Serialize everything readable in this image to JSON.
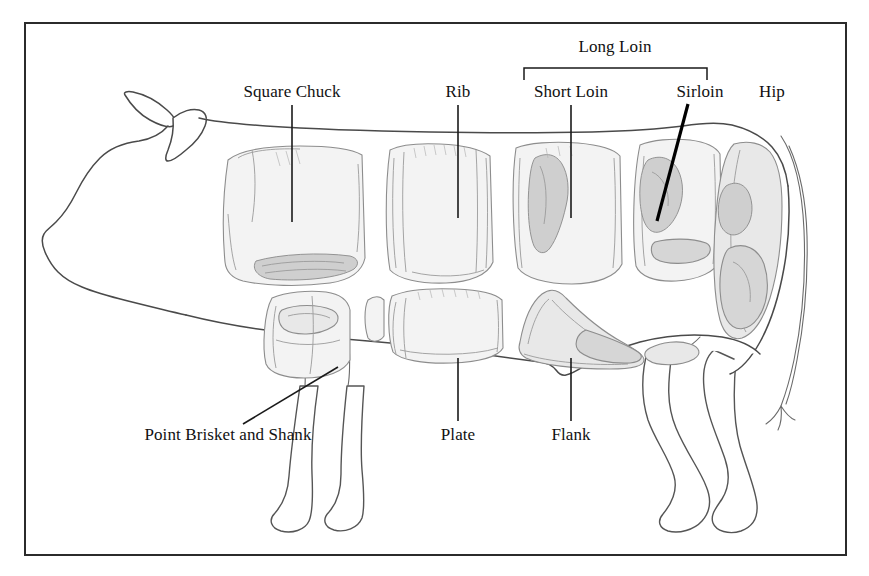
{
  "figure": {
    "name": "beef-carcass-cuts-diagram",
    "background_color": "#ffffff",
    "border_color": "#2b2b2b",
    "text_color": "#111111",
    "outline_color": "#4a4a4a",
    "frame": {
      "x": 24,
      "y": 22,
      "width": 822,
      "height": 533
    }
  },
  "labels": {
    "top": [
      {
        "key": "square-chuck",
        "text": "Square Chuck",
        "x": 292,
        "y": 97
      },
      {
        "key": "rib",
        "text": "Rib",
        "x": 458,
        "y": 97
      },
      {
        "key": "short-loin",
        "text": "Short Loin",
        "x": 571,
        "y": 97
      },
      {
        "key": "sirloin",
        "text": "Sirloin",
        "x": 700,
        "y": 97
      },
      {
        "key": "hip",
        "text": "Hip",
        "x": 772,
        "y": 97
      }
    ],
    "bracket": {
      "key": "long-loin",
      "text": "Long Loin",
      "x": 615,
      "y": 52
    },
    "bottom": [
      {
        "key": "point-brisket-and-shank",
        "text": "Point Brisket and Shank",
        "x": 228,
        "y": 440
      },
      {
        "key": "plate",
        "text": "Plate",
        "x": 458,
        "y": 440
      },
      {
        "key": "flank",
        "text": "Flank",
        "x": 571,
        "y": 440
      }
    ]
  },
  "leaders": {
    "square_chuck": {
      "x1": 292,
      "y1": 105,
      "x2": 292,
      "y2": 222
    },
    "rib": {
      "x1": 458,
      "y1": 105,
      "x2": 458,
      "y2": 218
    },
    "short_loin": {
      "x1": 571,
      "y1": 105,
      "x2": 571,
      "y2": 218
    },
    "sirloin": {
      "x1": 688,
      "y1": 104,
      "x2": 657,
      "y2": 221
    },
    "hip": {
      "x1": 772,
      "y1": 105,
      "x2": 772,
      "y2": 120
    },
    "plate": {
      "x1": 458,
      "y1": 358,
      "x2": 458,
      "y2": 421
    },
    "flank": {
      "x1": 571,
      "y1": 358,
      "x2": 571,
      "y2": 421
    },
    "point_brisket": {
      "x1": 243,
      "y1": 424,
      "x2": 338,
      "y2": 367
    }
  },
  "bracket_geometry": {
    "left_x": 524,
    "right_x": 707,
    "bar_y": 68,
    "tick_height": 12
  },
  "cuts": [
    {
      "key": "square-chuck",
      "name": "Square Chuck",
      "shade": "light"
    },
    {
      "key": "rib",
      "name": "Rib",
      "shade": "light"
    },
    {
      "key": "short-loin",
      "name": "Short Loin",
      "shade": "light"
    },
    {
      "key": "sirloin",
      "name": "Sirloin",
      "shade": "mid"
    },
    {
      "key": "hip",
      "name": "Hip",
      "shade": "mid"
    },
    {
      "key": "point-brisket-and-shank",
      "name": "Point Brisket and Shank",
      "shade": "light"
    },
    {
      "key": "plate",
      "name": "Plate",
      "shade": "light"
    },
    {
      "key": "flank",
      "name": "Flank",
      "shade": "mid"
    }
  ]
}
